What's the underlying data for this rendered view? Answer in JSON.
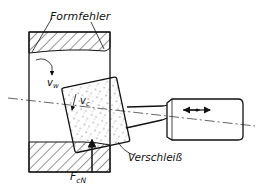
{
  "diagram": {
    "labels": {
      "form_error": "Formfehler",
      "workpiece_speed_main": "v",
      "workpiece_speed_sub": "w",
      "cutting_speed_main": "v",
      "cutting_speed_sub": "c",
      "wear": "Verschleiß",
      "normal_force_main": "F",
      "normal_force_sub": "cN"
    },
    "spindle_symbol": "oscillation-arrows"
  }
}
